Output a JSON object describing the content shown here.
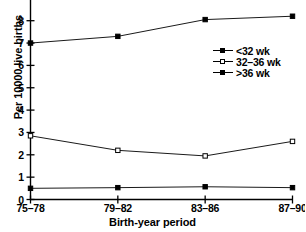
{
  "chart_data": {
    "type": "line",
    "title": "",
    "xlabel": "Birth-year period",
    "ylabel": "Per 10000 live births",
    "categories": [
      "75–78",
      "79–82",
      "83–86",
      "87–90"
    ],
    "xtick_labels": [
      "75–78",
      "79–82",
      "83–86",
      "87–90"
    ],
    "ytick_labels": [
      "0",
      "1",
      "2",
      "3",
      "4",
      "5",
      "6",
      "7",
      "8"
    ],
    "ylim": [
      0,
      9
    ],
    "xlim": [
      0,
      3
    ],
    "grid": false,
    "legend_position": "center-right",
    "series": [
      {
        "name": "<32 wk",
        "marker": "filled-square",
        "color": "#000000",
        "values": [
          7.0,
          7.3,
          8.05,
          8.2
        ]
      },
      {
        "name": "32–36 wk",
        "marker": "open-square",
        "color": "#000000",
        "values": [
          2.85,
          2.2,
          1.95,
          2.6
        ]
      },
      {
        "name": ">36 wk",
        "marker": "filled-square",
        "color": "#000000",
        "values": [
          0.5,
          0.53,
          0.57,
          0.53
        ]
      }
    ],
    "annotations": []
  },
  "legend": {
    "items": [
      {
        "label": "<32 wk",
        "marker": "filled-square"
      },
      {
        "label": "32–36 wk",
        "marker": "open-square"
      },
      {
        "label": ">36 wk",
        "marker": "filled-square"
      }
    ]
  },
  "axes": {
    "y_title": "Per 10000 live births",
    "x_title": "Birth-year period"
  }
}
